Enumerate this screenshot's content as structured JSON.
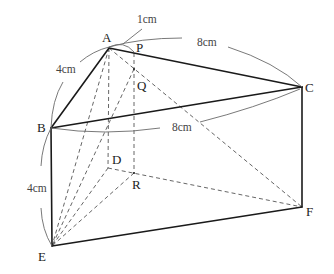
{
  "figure": {
    "type": "triangular-prism",
    "points": {
      "A": "A",
      "P": "P",
      "Q": "Q",
      "B": "B",
      "C": "C",
      "D": "D",
      "R": "R",
      "E": "E",
      "F": "F"
    },
    "measurements": {
      "AB": "4cm",
      "AP": "1cm",
      "AC": "8cm",
      "BC": "8cm",
      "BE": "4cm"
    }
  }
}
